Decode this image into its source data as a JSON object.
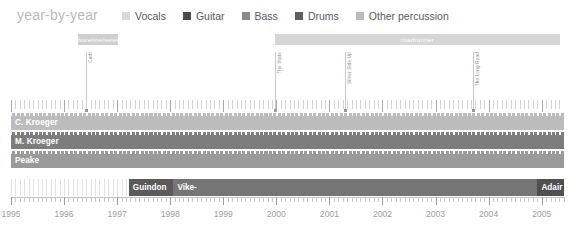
{
  "header": {
    "title": "year-by-year",
    "legend": [
      {
        "label": "Vocals",
        "color": "#d8d8d8"
      },
      {
        "label": "Guitar",
        "color": "#4a4a4a"
      },
      {
        "label": "Bass",
        "color": "#8a8a8a"
      },
      {
        "label": "Drums",
        "color": "#5f5f5f"
      },
      {
        "label": "Other percussion",
        "color": "#bdbdbd"
      }
    ]
  },
  "label_bands": [
    {
      "text": "shoreline/select",
      "color": "#cfcfcf",
      "start": 1996.27,
      "end": 1997.02
    },
    {
      "text": "roadrunner",
      "color": "#d6d6d6",
      "start": 1999.97,
      "end": 2005.35
    }
  ],
  "album_markers": [
    {
      "label": "Curb",
      "year": 1996.42
    },
    {
      "label": "The State",
      "year": 1999.98
    },
    {
      "label": "Silver Side Up",
      "year": 2001.3
    },
    {
      "label": "The Long Road",
      "year": 2003.7
    }
  ],
  "rows": [
    {
      "name": "C. Kroeger",
      "color": "#bcbcbc",
      "start": 1995.0,
      "end": 2005.42
    },
    {
      "name": "M. Kroeger",
      "color": "#7d7d7d",
      "start": 1995.0,
      "end": 2005.42
    },
    {
      "name": "Peake",
      "color": "#9a9a9a",
      "start": 1995.0,
      "end": 2005.42
    }
  ],
  "bottom_segments": [
    {
      "label": "",
      "color": "#ffffff",
      "start": 1995.0,
      "end": 1997.22
    },
    {
      "label": "Guindon",
      "color": "#5a5a5a",
      "start": 1997.22,
      "end": 1998.06
    },
    {
      "label": "Vike-",
      "color": "#757575",
      "start": 1998.06,
      "end": 2004.92
    },
    {
      "label": "Adair",
      "color": "#4f4f4f",
      "start": 2004.92,
      "end": 2005.42
    }
  ],
  "axis": {
    "min": 1995,
    "max": 2005.42,
    "ticks": [
      1995,
      1996,
      1997,
      1998,
      1999,
      2000,
      2001,
      2002,
      2003,
      2004,
      2005
    ],
    "tick_labels": [
      "1995",
      "1996",
      "1997",
      "1998",
      "1999",
      "2000",
      "2001",
      "2002",
      "2003",
      "2004",
      "2005"
    ]
  },
  "chart_data": {
    "type": "bar",
    "title": "year-by-year",
    "xlabel": "",
    "ylabel": "",
    "xlim": [
      1995,
      2005.42
    ],
    "grid": false,
    "legend_position": "top",
    "categories": [
      "C. Kroeger",
      "M. Kroeger",
      "Peake",
      "Drummer"
    ],
    "series": [
      {
        "name": "C. Kroeger",
        "role": "Vocals",
        "start": 1995.0,
        "end": 2005.42
      },
      {
        "name": "M. Kroeger",
        "role": "Bass",
        "start": 1995.0,
        "end": 2005.42
      },
      {
        "name": "Peake",
        "role": "Guitar",
        "start": 1995.0,
        "end": 2005.42
      },
      {
        "name": "Guindon",
        "role": "Drums",
        "start": 1997.22,
        "end": 1998.06
      },
      {
        "name": "Vike-",
        "role": "Drums",
        "start": 1998.06,
        "end": 2004.92
      },
      {
        "name": "Adair",
        "role": "Drums",
        "start": 2004.92,
        "end": 2005.42
      }
    ],
    "annotations": [
      {
        "text": "Curb",
        "x": 1996.42
      },
      {
        "text": "The State",
        "x": 1999.98
      },
      {
        "text": "Silver Side Up",
        "x": 2001.3
      },
      {
        "text": "The Long Road",
        "x": 2003.7
      },
      {
        "text": "shoreline/select",
        "x_start": 1996.27,
        "x_end": 1997.02
      },
      {
        "text": "roadrunner",
        "x_start": 1999.97,
        "x_end": 2005.35
      }
    ]
  }
}
